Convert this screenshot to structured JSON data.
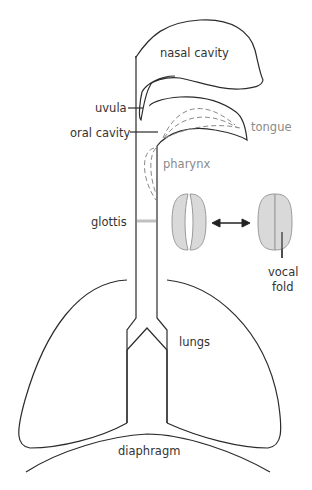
{
  "diagram": {
    "labels": {
      "nasal_cavity": "nasal cavity",
      "uvula": "uvula",
      "oral_cavity": "oral cavity",
      "tongue": "tongue",
      "pharynx": "pharynx",
      "glottis": "glottis",
      "vocal_fold_line1": "vocal",
      "vocal_fold_line2": "fold",
      "lungs": "lungs",
      "diaphragm": "diaphragm"
    },
    "colors": {
      "outline": "#2b2b2b",
      "fold_fill": "#d9d9d9",
      "fold_stroke": "#9a9a9a",
      "glottis_bar": "#c0c0c0",
      "dashed": "#8a8a8a",
      "grey_label": "#8a8a8a"
    },
    "states": [
      "open glottis",
      "closed glottis"
    ]
  }
}
